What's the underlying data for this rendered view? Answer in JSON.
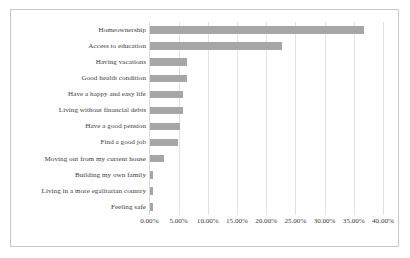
{
  "chart_data": {
    "type": "bar",
    "orientation": "horizontal",
    "title": "",
    "subtitle": "",
    "xlabel": "",
    "ylabel": "",
    "xlim": [
      0,
      40
    ],
    "xtick_labels": [
      "0.00%",
      "5.00%",
      "10.00%",
      "15.00%",
      "20.00%",
      "25.00%",
      "30.00%",
      "35.00%",
      "40.00%"
    ],
    "xtick_values": [
      0,
      5,
      10,
      15,
      20,
      25,
      30,
      35,
      40
    ],
    "grid": "vertical",
    "legend": "none",
    "bar_color": "#a6a6a6",
    "value_unit": "%",
    "categories": [
      "Homeownership",
      "Access to education",
      "Having vacations",
      "Good health condition",
      "Have a happy and easy life",
      "Living without financial debts",
      "Have a good pension",
      "Find a good job",
      "Moving out from my current house",
      "Building my own family",
      "Living in a more egalitarian country",
      "Feeling safe"
    ],
    "values": [
      36.5,
      22.6,
      6.2,
      6.2,
      5.6,
      5.6,
      5.0,
      4.8,
      2.4,
      0.5,
      0.5,
      0.5
    ]
  }
}
